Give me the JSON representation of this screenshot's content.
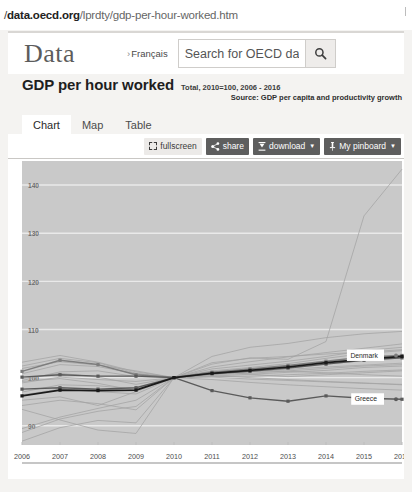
{
  "browser": {
    "url_prefix": "/",
    "url_domain": "data.oecd.org",
    "url_path": "/lprdty/gdp-per-hour-worked.htm"
  },
  "header": {
    "brand": "Data",
    "language_link": "Français",
    "language_chevron": "›",
    "search_placeholder": "Search for OECD data",
    "search_value": "",
    "search_icon": "search-icon"
  },
  "indicator": {
    "title": "GDP per hour worked",
    "subtitle": "Total, 2010=100, 2006 - 2016",
    "source": "Source: GDP per capita and productivity growth"
  },
  "tabs": [
    {
      "label": "Chart",
      "active": true
    },
    {
      "label": "Map",
      "active": false
    },
    {
      "label": "Table",
      "active": false
    }
  ],
  "toolbar": {
    "fullscreen_label": "fullscreen",
    "share_label": "share",
    "download_label": "download",
    "pinboard_label": "My pinboard",
    "caret": "▼"
  },
  "colors": {
    "plot_background": "#c9c9c9",
    "gridline": "#e9e9e9",
    "highlight_dark": "#1a1a1a",
    "highlight_mid": "#5a5a5a",
    "highlight_grey": "#7d7d7d",
    "faint_series": "#a3a3a3",
    "panel_background": "#ffffff",
    "toolbar_button": "#5e5e5e",
    "page_background": "#f4f3f1"
  },
  "chart_data": {
    "type": "line",
    "title": "GDP per hour worked",
    "subtitle": "Total, 2010=100, 2006 - 2016",
    "xlabel": "",
    "ylabel": "",
    "x": [
      2006,
      2007,
      2008,
      2009,
      2010,
      2011,
      2012,
      2013,
      2014,
      2015,
      2016
    ],
    "xlim": [
      2006,
      2016
    ],
    "ylim": [
      86,
      145
    ],
    "yticks": [
      90,
      100,
      110,
      120,
      130,
      140
    ],
    "xticks": [
      "2006",
      "2007",
      "2008",
      "2009",
      "2010",
      "2011",
      "2012",
      "2013",
      "2014",
      "2015",
      "2016"
    ],
    "grid": true,
    "legend": "inline-end-labels",
    "annotations": [
      "Denmark",
      "Greece"
    ],
    "series": [
      {
        "name": "Denmark",
        "label": "Denmark",
        "emphasis": "grey",
        "markers": true,
        "values": [
          101.3,
          103.6,
          102.7,
          100.6,
          100.0,
          101.1,
          101.8,
          102.5,
          103.4,
          104.3,
          104.6
        ]
      },
      {
        "name": "Series B",
        "label": "",
        "emphasis": "mid",
        "markers": true,
        "values": [
          97.6,
          97.9,
          97.6,
          97.9,
          100.0,
          100.8,
          101.3,
          102.0,
          102.8,
          103.6,
          104.1
        ]
      },
      {
        "name": "Series C",
        "label": "",
        "emphasis": "dark",
        "markers": true,
        "values": [
          96.2,
          97.4,
          97.3,
          97.4,
          100.0,
          100.9,
          101.5,
          102.2,
          103.1,
          103.8,
          104.4
        ]
      },
      {
        "name": "Greece",
        "label": "Greece",
        "emphasis": "mid",
        "markers": true,
        "values": [
          100.1,
          100.6,
          100.3,
          100.3,
          100.0,
          97.3,
          95.8,
          95.1,
          96.2,
          95.7,
          95.5
        ]
      },
      {
        "name": "Ireland",
        "label": "",
        "emphasis": "faint",
        "markers": false,
        "values": [
          95.3,
          96.0,
          94.2,
          97.1,
          100.0,
          102.8,
          104.1,
          103.8,
          107.5,
          133.6,
          143.3
        ]
      },
      {
        "name": "Faint 1",
        "label": "",
        "emphasis": "faint",
        "markers": false,
        "values": [
          100.8,
          102.7,
          102.3,
          100.8,
          100.0,
          101.0,
          101.6,
          102.4,
          103.0,
          103.8,
          104.2
        ]
      },
      {
        "name": "Faint 2",
        "label": "",
        "emphasis": "faint",
        "markers": false,
        "values": [
          99.4,
          101.2,
          101.4,
          100.2,
          100.0,
          101.4,
          102.1,
          102.9,
          104.0,
          105.0,
          105.6
        ]
      },
      {
        "name": "Faint 3",
        "label": "",
        "emphasis": "faint",
        "markers": false,
        "values": [
          98.9,
          100.1,
          99.6,
          99.2,
          100.0,
          100.3,
          100.7,
          101.1,
          101.5,
          102.1,
          102.4
        ]
      },
      {
        "name": "Faint 4",
        "label": "",
        "emphasis": "faint",
        "markers": false,
        "values": [
          102.4,
          104.0,
          103.1,
          100.9,
          100.0,
          100.6,
          100.9,
          101.4,
          101.9,
          102.4,
          102.7
        ]
      },
      {
        "name": "Faint 5",
        "label": "",
        "emphasis": "faint",
        "markers": false,
        "values": [
          97.0,
          98.5,
          98.3,
          97.6,
          100.0,
          101.8,
          102.6,
          103.4,
          104.4,
          105.6,
          106.3
        ]
      },
      {
        "name": "Faint 6",
        "label": "",
        "emphasis": "faint",
        "markers": false,
        "values": [
          99.8,
          100.9,
          100.1,
          98.6,
          100.0,
          100.1,
          99.7,
          99.4,
          99.1,
          98.8,
          98.6
        ]
      },
      {
        "name": "Faint 7",
        "label": "",
        "emphasis": "faint",
        "markers": false,
        "values": [
          96.4,
          97.6,
          97.1,
          96.6,
          100.0,
          101.2,
          101.4,
          101.3,
          101.0,
          100.6,
          100.3
        ]
      },
      {
        "name": "Faint 8",
        "label": "",
        "emphasis": "faint",
        "markers": false,
        "values": [
          89.4,
          91.8,
          93.6,
          95.3,
          100.0,
          104.4,
          106.3,
          107.1,
          108.3,
          109.1,
          109.6
        ]
      },
      {
        "name": "Faint 9",
        "label": "",
        "emphasis": "faint",
        "markers": false,
        "values": [
          88.6,
          91.4,
          93.0,
          94.0,
          100.0,
          102.2,
          103.3,
          104.3,
          105.2,
          106.1,
          107.0
        ]
      },
      {
        "name": "Faint 10",
        "label": "",
        "emphasis": "faint",
        "markers": false,
        "values": [
          94.2,
          95.3,
          94.6,
          93.3,
          100.0,
          101.3,
          100.7,
          100.2,
          100.6,
          101.0,
          101.4
        ]
      },
      {
        "name": "Faint 11",
        "label": "",
        "emphasis": "faint",
        "markers": false,
        "values": [
          93.4,
          91.2,
          89.1,
          88.4,
          100.0,
          103.1,
          104.0,
          104.4,
          104.9,
          105.3,
          105.8
        ]
      },
      {
        "name": "Faint 12",
        "label": "",
        "emphasis": "faint",
        "markers": false,
        "values": [
          86.8,
          89.6,
          91.1,
          90.6,
          100.0,
          100.4,
          100.0,
          99.6,
          99.2,
          98.9,
          98.5
        ]
      },
      {
        "name": "Faint 13",
        "label": "",
        "emphasis": "faint",
        "markers": false,
        "values": [
          103.2,
          104.6,
          103.2,
          101.2,
          100.0,
          100.2,
          100.3,
          100.6,
          100.9,
          101.3,
          101.6
        ]
      },
      {
        "name": "Faint 14",
        "label": "",
        "emphasis": "faint",
        "markers": false,
        "values": [
          99.2,
          99.8,
          98.8,
          97.3,
          100.0,
          99.6,
          99.0,
          98.5,
          98.1,
          97.7,
          97.4
        ]
      },
      {
        "name": "Faint 15",
        "label": "",
        "emphasis": "faint",
        "markers": false,
        "values": [
          101.9,
          103.3,
          102.6,
          101.4,
          100.0,
          100.9,
          101.2,
          101.7,
          102.2,
          102.6,
          103.0
        ]
      }
    ]
  }
}
